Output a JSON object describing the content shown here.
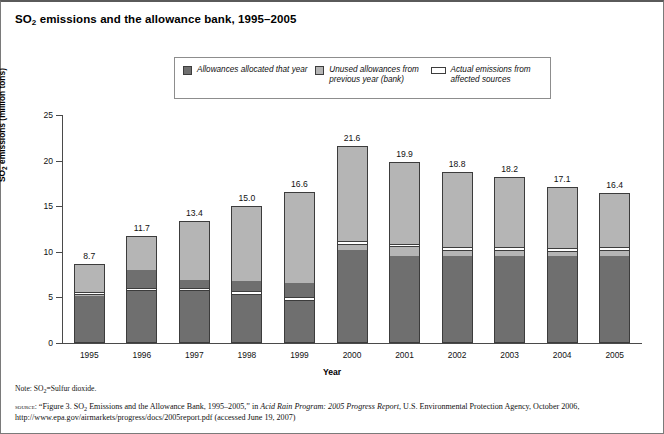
{
  "figure": {
    "title_main": "SO",
    "title_sub": "2",
    "title_rest": " emissions and the allowance bank, 1995–2005",
    "note_label": "Note: SO",
    "note_sub": "2",
    "note_rest": "=Sulfur dioxide.",
    "source_kw": "source:",
    "source_a": " “Figure 3. SO",
    "source_sub": "2",
    "source_b": " Emissions and the Allowance Bank, 1995–2005,” in ",
    "source_italic": "Acid Rain Program: 2005 Progress Report",
    "source_c": ", U.S. Environmental Protection Agency, October 2006, http://www.epa.gov/airmarkets/progress/docs/2005report.pdf (accessed June 19, 2007)"
  },
  "legend": {
    "items": [
      {
        "label": "Allowances allocated that year",
        "swatch": "square-dark-gray",
        "color": "#6f6f6f"
      },
      {
        "label": "Unused allowances from previous year (bank)",
        "swatch": "square-light-gray",
        "color": "#b5b5b5"
      },
      {
        "label": "Actual emissions from affected sources",
        "swatch": "line-band",
        "color": "#ffffff"
      }
    ]
  },
  "chart_data": {
    "type": "bar",
    "title": "SO2 emissions and the allowance bank, 1995–2005",
    "xlabel": "Year",
    "ylabel": "SO2 emissions (million tons)",
    "ylim": [
      0,
      25
    ],
    "yticks": [
      0,
      5,
      10,
      15,
      20,
      25
    ],
    "grid": false,
    "legend_position": "top-center",
    "categories": [
      "1995",
      "1996",
      "1997",
      "1998",
      "1999",
      "2000",
      "2001",
      "2002",
      "2003",
      "2004",
      "2005"
    ],
    "totals": [
      8.7,
      11.7,
      13.4,
      15.0,
      16.6,
      21.6,
      19.9,
      18.8,
      18.2,
      17.1,
      16.4
    ],
    "data_labels": [
      "8.7",
      "11.7",
      "13.4",
      "15.0",
      "16.6",
      "21.6",
      "19.9",
      "18.8",
      "18.2",
      "17.1",
      "16.4"
    ],
    "series": [
      {
        "name": "Allowances allocated that year",
        "color": "#6f6f6f",
        "values": [
          5.1,
          5.5,
          5.5,
          5.1,
          4.4,
          10.1,
          9.4,
          9.4,
          9.4,
          9.4,
          9.4
        ]
      },
      {
        "name": "Actual emissions from affected sources",
        "color": "#ffffff",
        "values": [
          5.4,
          5.8,
          5.8,
          5.4,
          4.8,
          11.2,
          10.6,
          10.2,
          10.2,
          10.1,
          10.2
        ]
      },
      {
        "name": "Unused allowances from previous year (bank)",
        "color": "#b5b5b5",
        "values": [
          3.3,
          5.9,
          7.6,
          9.6,
          11.8,
          10.4,
          9.3,
          8.6,
          8.0,
          7.0,
          6.2
        ]
      }
    ],
    "segment_tops_dark": [
      5.1,
      7.9,
      6.8,
      6.7,
      6.5,
      10.1,
      9.4,
      9.4,
      9.4,
      9.4,
      9.4
    ],
    "emission_band": [
      {
        "year": "1995",
        "low": 5.15,
        "high": 5.45
      },
      {
        "year": "1996",
        "low": 5.55,
        "high": 5.95
      },
      {
        "year": "1997",
        "low": 5.55,
        "high": 5.95
      },
      {
        "year": "1998",
        "low": 5.15,
        "high": 5.55
      },
      {
        "year": "1999",
        "low": 4.55,
        "high": 4.95
      },
      {
        "year": "2000",
        "low": 10.65,
        "high": 11.05
      },
      {
        "year": "2001",
        "low": 10.4,
        "high": 10.8
      },
      {
        "year": "2002",
        "low": 10.0,
        "high": 10.4
      },
      {
        "year": "2003",
        "low": 10.0,
        "high": 10.4
      },
      {
        "year": "2004",
        "low": 9.9,
        "high": 10.3
      },
      {
        "year": "2005",
        "low": 10.0,
        "high": 10.4
      }
    ]
  }
}
